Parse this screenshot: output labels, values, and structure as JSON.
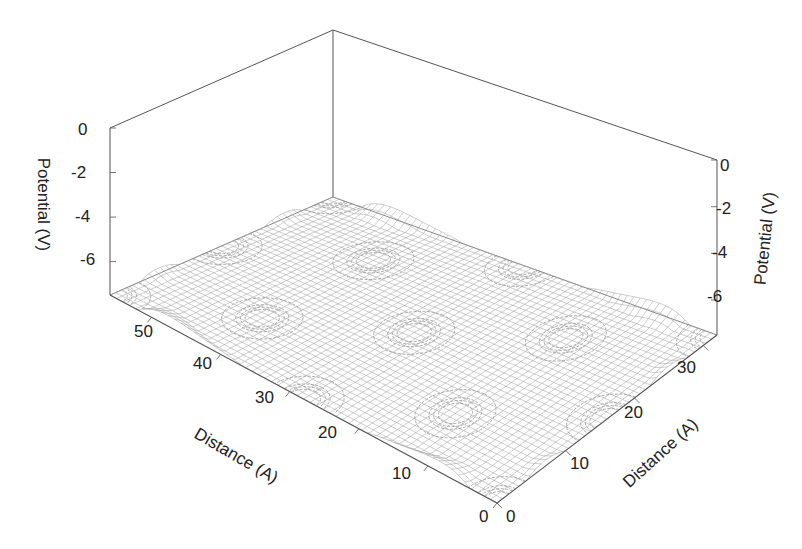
{
  "chart_data": {
    "type": "surface3d",
    "title": "",
    "xlabel": "Distance (A)",
    "ylabel": "Distance (A)",
    "zlabel": "Potential (V)",
    "x_axis": {
      "label": "Distance (A)",
      "range": [
        0,
        32
      ],
      "ticks": [
        "0",
        "10",
        "20",
        "30"
      ]
    },
    "y_axis": {
      "label": "Distance (A)",
      "range": [
        0,
        56
      ],
      "ticks": [
        "0",
        "10",
        "20",
        "30",
        "40",
        "50"
      ]
    },
    "z_axis_left": {
      "label": "Potential (V)",
      "range": [
        -7.5,
        0
      ],
      "ticks": [
        "0",
        "-2",
        "-4",
        "-6"
      ]
    },
    "z_axis_right": {
      "label": "Potential (V)",
      "range": [
        -7.5,
        0
      ],
      "ticks": [
        "0",
        "-2",
        "-4",
        "-6"
      ]
    },
    "surface": {
      "plateau_value": -0.8,
      "well_depth_min": -7.5,
      "well_centers_fraction": [
        [
          0.0,
          0.0
        ],
        [
          0.5,
          0.0
        ],
        [
          1.0,
          0.0
        ],
        [
          0.25,
          0.25
        ],
        [
          0.75,
          0.25
        ],
        [
          0.0,
          0.5
        ],
        [
          0.5,
          0.5
        ],
        [
          1.0,
          0.5
        ],
        [
          0.25,
          0.75
        ],
        [
          0.75,
          0.75
        ],
        [
          0.0,
          1.0
        ],
        [
          0.5,
          1.0
        ],
        [
          1.0,
          1.0
        ]
      ],
      "mesh_lines_x": 40,
      "mesh_lines_y": 60
    },
    "contours": {
      "levels": [
        -1.2,
        -1.6,
        -2.0,
        -2.6
      ],
      "projected_on_floor": true
    },
    "grid": false,
    "legend": null,
    "colors": {
      "mesh": "#9a9a9a",
      "axis": "#555555",
      "contour": "#8a8a8a",
      "text": "#222222"
    }
  },
  "labels": {
    "z_left_ticks": [
      "0",
      "-2",
      "-4",
      "-6"
    ],
    "z_right_ticks": [
      "0",
      "-2",
      "-4",
      "-6"
    ],
    "y_ticks": [
      "50",
      "40",
      "30",
      "20",
      "10",
      "0"
    ],
    "x_ticks": [
      "0",
      "10",
      "20",
      "30"
    ],
    "z_left_title": "Potential (V)",
    "z_right_title": "Potential (V)",
    "y_title": "Distance (A)",
    "x_title": "Distance (A)"
  }
}
